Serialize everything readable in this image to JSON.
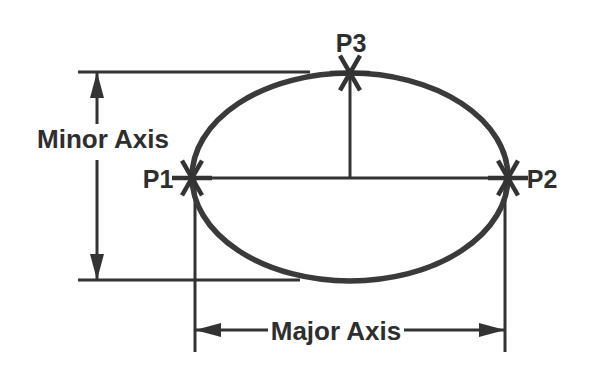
{
  "diagram": {
    "type": "geometry-diagram",
    "canvas": {
      "width": 593,
      "height": 372,
      "background": "#ffffff"
    },
    "colors": {
      "stroke": "#333333",
      "ellipse_stroke": "#3a3a3a",
      "text": "#2e2e2e",
      "background": "#ffffff"
    },
    "ellipse": {
      "center_x": 350,
      "center_y": 177,
      "radius_x": 158,
      "radius_y": 104,
      "stroke_width": 5.5
    },
    "points": [
      {
        "id": "P1",
        "label": "P1",
        "x": 192,
        "y": 178,
        "label_x": 158,
        "label_y": 188,
        "label_anchor": "middle",
        "marker": "asterisk-6"
      },
      {
        "id": "P2",
        "label": "P2",
        "x": 508,
        "y": 178,
        "label_x": 542,
        "label_y": 188,
        "label_anchor": "middle",
        "marker": "asterisk-6"
      },
      {
        "id": "P3",
        "label": "P3",
        "x": 350,
        "y": 73,
        "label_x": 351,
        "label_y": 52,
        "label_anchor": "middle",
        "marker": "asterisk-6"
      }
    ],
    "marker": {
      "arm_length": 20,
      "stroke_width": 4.5,
      "arm_count": 3,
      "arm_angles_deg": [
        0,
        60,
        120
      ]
    },
    "axes": [
      {
        "id": "minor-axis",
        "label": "Minor Axis",
        "label_x": 103,
        "label_y": 148,
        "label_anchor": "middle",
        "orientation": "vertical",
        "dimension_x": 97,
        "from_y": 72,
        "to_y": 280,
        "gap_top_y": 124,
        "gap_bottom_y": 160,
        "arrow_style": "double-outward"
      },
      {
        "id": "major-axis",
        "label": "Major Axis",
        "label_x": 336,
        "label_y": 340,
        "label_anchor": "middle",
        "orientation": "horizontal",
        "dimension_y": 330,
        "from_x": 195,
        "to_x": 505,
        "gap_left_x": 268,
        "gap_right_x": 404,
        "arrow_style": "double-outward"
      }
    ],
    "extension_lines": [
      {
        "id": "ext-top",
        "x1": 78,
        "y1": 72,
        "x2": 310,
        "y2": 72,
        "width": 3
      },
      {
        "id": "ext-bottom",
        "x1": 78,
        "y1": 280,
        "x2": 300,
        "y2": 280,
        "width": 3
      },
      {
        "id": "ext-p1-vertical",
        "x1": 195,
        "y1": 180,
        "x2": 195,
        "y2": 352,
        "width": 3
      },
      {
        "id": "ext-p2-vertical",
        "x1": 505,
        "y1": 180,
        "x2": 505,
        "y2": 352,
        "width": 3
      }
    ],
    "chords": [
      {
        "id": "major-chord",
        "x1": 192,
        "y1": 178,
        "x2": 508,
        "y2": 178,
        "width": 3
      },
      {
        "id": "p3-drop-line",
        "x1": 350,
        "y1": 73,
        "x2": 350,
        "y2": 178,
        "width": 3
      }
    ],
    "arrowhead": {
      "length": 26,
      "half_width": 7
    }
  }
}
